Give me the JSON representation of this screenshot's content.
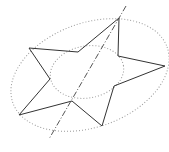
{
  "diagram": {
    "width": 169,
    "height": 152,
    "background": "#ffffff",
    "star": {
      "stroke": "#333333",
      "points": [
        [
          119,
          18
        ],
        [
          118,
          56
        ],
        [
          165,
          66
        ],
        [
          114,
          86
        ],
        [
          102,
          126
        ],
        [
          72,
          101
        ],
        [
          19,
          115
        ],
        [
          50,
          79
        ],
        [
          29,
          48
        ],
        [
          78,
          52
        ]
      ]
    },
    "outer_ellipse": {
      "cx": 90,
      "cy": 75,
      "rx": 82,
      "ry": 52,
      "rotate": -20,
      "stroke": "#999999"
    },
    "inner_ellipse": {
      "cx": 87,
      "cy": 72,
      "rx": 37,
      "ry": 26,
      "rotate": -10,
      "stroke": "#999999"
    },
    "axis_line": {
      "x1": 126,
      "y1": 6,
      "x2": 49,
      "y2": 139,
      "stroke": "#555555"
    }
  }
}
